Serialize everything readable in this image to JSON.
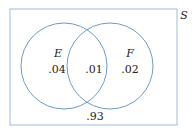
{
  "diagram": {
    "type": "venn",
    "universe_label": "S",
    "sets": [
      {
        "name": "E",
        "only_value": ".04"
      },
      {
        "name": "F",
        "only_value": ".02"
      }
    ],
    "intersection_value": ".01",
    "outside_value": ".93",
    "colors": {
      "stroke": "#8fb3d3",
      "circle_stroke": "#6a9cc9",
      "text": "#222222"
    }
  }
}
